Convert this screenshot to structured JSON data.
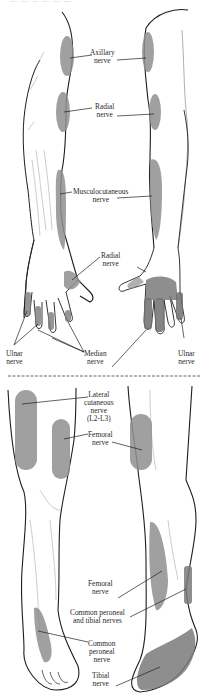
{
  "figure": {
    "header_fragment": "— — — — — —",
    "colors": {
      "outline": "#1e1e1e",
      "sketch": "#9a9a9a",
      "shade": "#8f8f8f",
      "shade_dark": "#6e6e6e",
      "label": "#2a2a2a",
      "divider": "#555555"
    },
    "upper_panel": {
      "title": "Upper limb cutaneous nerve distribution",
      "labels": {
        "axillary": [
          "Axillary",
          "nerve"
        ],
        "radial_arm": [
          "Radial",
          "nerve"
        ],
        "musculocutaneous": [
          "Musculocutaneous",
          "nerve"
        ],
        "radial_hand": [
          "Radial",
          "nerve"
        ],
        "ulnar_left": [
          "Ulnar",
          "nerve"
        ],
        "median": [
          "Median",
          "nerve"
        ],
        "ulnar_right": [
          "Ulnar",
          "nerve"
        ]
      }
    },
    "lower_panel": {
      "title": "Lower limb cutaneous nerve distribution",
      "labels": {
        "lateral_cutaneous": [
          "Lateral",
          "cutaneous",
          "nerve",
          "(L2-L3)"
        ],
        "femoral_thigh": [
          "Femoral",
          "nerve"
        ],
        "femoral_leg": [
          "Femoral",
          "nerve"
        ],
        "common_peroneal_tibial": [
          "Common peroneal",
          "and tibial nerves"
        ],
        "common_peroneal": [
          "Common",
          "peroneal",
          "nerve"
        ],
        "tibial": [
          "Tibial",
          "nerve"
        ]
      }
    }
  }
}
